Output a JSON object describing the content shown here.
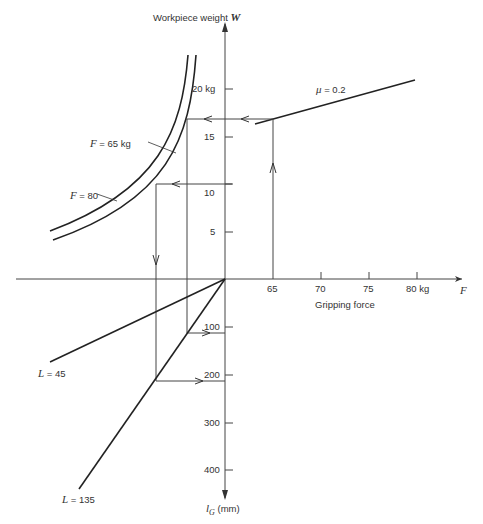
{
  "y_axis": {
    "title_prefix": "Workpiece weight ",
    "title_var": "W",
    "ticks_up": [
      {
        "label": "5",
        "y": 232
      },
      {
        "label": "10",
        "y": 184
      },
      {
        "label": "15",
        "y": 137
      },
      {
        "label": "20 kg",
        "y": 89
      }
    ],
    "ticks_down": [
      {
        "label": "100",
        "y": 327
      },
      {
        "label": "200",
        "y": 375
      },
      {
        "label": "300",
        "y": 423
      },
      {
        "label": "400",
        "y": 470
      }
    ],
    "bottom_var": "l",
    "bottom_sub": "G",
    "bottom_unit": " (mm)"
  },
  "x_axis": {
    "ticks": [
      {
        "label": "65",
        "x": 273
      },
      {
        "label": "70",
        "x": 321
      },
      {
        "label": "75",
        "x": 369
      },
      {
        "label": "80 kg",
        "x": 417
      }
    ],
    "title": "Gripping force",
    "var": "F"
  },
  "curves": {
    "f65_label_var": "F",
    "f65_label_rest": " = 65 kg",
    "f80_label_var": "F",
    "f80_label_rest": " = 80",
    "mu_label_var": "μ",
    "mu_label_rest": " = 0.2",
    "l45_label_var": "L",
    "l45_label_rest": " = 45",
    "l135_label_var": "L",
    "l135_label_rest": " = 135"
  },
  "colors": {
    "line": "#222222",
    "axis": "#444444",
    "text": "#333333"
  }
}
